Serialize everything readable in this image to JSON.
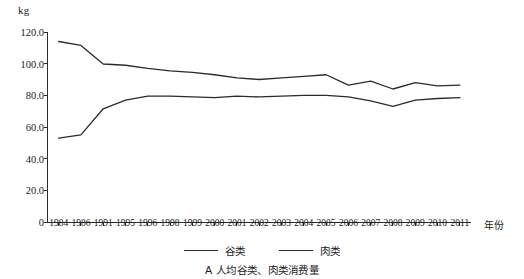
{
  "chart_data": {
    "type": "line",
    "title": "",
    "caption": "A 人均谷类、肉类消费量",
    "unit_label": "kg",
    "xlabel": "年份",
    "ylabel": "",
    "grid": false,
    "legend_position": "bottom",
    "ylim": [
      0,
      120
    ],
    "yticks": [
      "0",
      "20.0",
      "40.0",
      "60.0",
      "80.0",
      "100.0",
      "120.0"
    ],
    "ytick_values": [
      0,
      20,
      40,
      60,
      80,
      100,
      120
    ],
    "categories": [
      "1984",
      "1986",
      "1991",
      "1995",
      "1996",
      "1998",
      "1999",
      "2000",
      "2001",
      "2002",
      "2003",
      "2004",
      "2005",
      "2006",
      "2007",
      "2008",
      "2009",
      "2010",
      "2011"
    ],
    "series": [
      {
        "name": "谷类",
        "color": "#2b2b2b",
        "values": [
          114.0,
          111.5,
          99.8,
          99.0,
          97.0,
          95.5,
          94.5,
          93.0,
          91.0,
          90.0,
          91.0,
          92.0,
          93.0,
          86.5,
          89.0,
          84.0,
          88.0,
          86.0,
          86.5
        ]
      },
      {
        "name": "肉类",
        "color": "#2b2b2b",
        "values": [
          53.0,
          55.0,
          71.5,
          77.0,
          79.5,
          79.5,
          79.0,
          78.5,
          79.5,
          79.0,
          79.5,
          80.0,
          80.0,
          79.0,
          76.5,
          73.0,
          77.0,
          78.0,
          78.5
        ]
      }
    ]
  },
  "legend": {
    "items": [
      {
        "label": "谷类"
      },
      {
        "label": "肉类"
      }
    ]
  }
}
